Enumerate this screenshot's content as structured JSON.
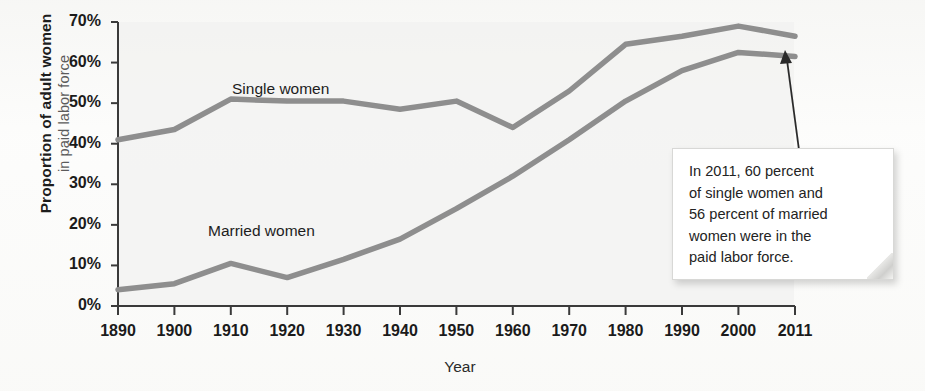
{
  "chart_data": {
    "type": "line",
    "title": "",
    "xlabel": "Year",
    "ylabel": "Proportion of adult women in paid labor force",
    "ylabel_main": "Proportion of adult women",
    "ylabel_sub": "in paid labor force",
    "x": [
      1890,
      1900,
      1910,
      1920,
      1930,
      1940,
      1950,
      1960,
      1970,
      1980,
      1990,
      2000,
      2011
    ],
    "categories": [
      "1890",
      "1900",
      "1910",
      "1920",
      "1930",
      "1940",
      "1950",
      "1960",
      "1970",
      "1980",
      "1990",
      "2000",
      "2011"
    ],
    "xtick_labels": [
      "1890",
      "1900",
      "1910",
      "1920",
      "1930",
      "1940",
      "1950",
      "1960",
      "1970",
      "1980",
      "1990",
      "2000",
      "2011"
    ],
    "ytick_labels": [
      "0%",
      "10%",
      "20%",
      "30%",
      "40%",
      "50%",
      "60%",
      "70%"
    ],
    "ytick_values": [
      0,
      10,
      20,
      30,
      40,
      50,
      60,
      70
    ],
    "ylim": [
      0,
      70
    ],
    "xlim": [
      1890,
      2011
    ],
    "grid": false,
    "legend_position": "inline-labels",
    "series": [
      {
        "name": "Single women",
        "color": "#8e8e8e",
        "values": [
          41,
          43.5,
          51,
          50.5,
          50.5,
          48.5,
          50.5,
          44,
          53,
          64.5,
          66.5,
          69,
          66.5
        ]
      },
      {
        "name": "Married women",
        "color": "#8e8e8e",
        "values": [
          4,
          5.5,
          10.5,
          7,
          11.5,
          16.5,
          24,
          32,
          41,
          50.5,
          58,
          62.5,
          61.5
        ]
      }
    ],
    "annotations": [
      {
        "name": "callout-2011",
        "text": "In 2011, 60 percent of single women and 56 percent of married women were in the paid labor force.",
        "lines": [
          "In 2011, 60 percent",
          "of single women and",
          "56 percent of married",
          "women were in the",
          "paid labor force."
        ],
        "points_to_year": 2011
      }
    ]
  },
  "axis": {
    "line_color": "#3a3a3a",
    "tick_color": "#3a3a3a"
  }
}
